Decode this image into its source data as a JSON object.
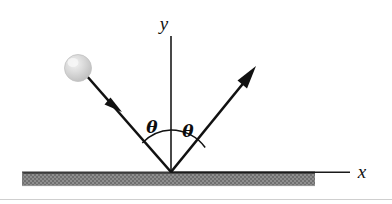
{
  "figure": {
    "background_color": "#ffffff",
    "width": 392,
    "height": 204
  },
  "axes": {
    "y_label": "y",
    "x_label": "x",
    "axis_color": "#1a1a1a",
    "origin": {
      "x": 171,
      "y": 172
    },
    "y_axis_top": {
      "x": 171,
      "y": 36
    },
    "x_axis_right": {
      "x": 350,
      "y": 172
    }
  },
  "ground": {
    "name": "hatched-surface",
    "fill_color": "#8a8a8a",
    "edge_color": "#4a4a4a",
    "x_start": 22,
    "x_end": 315,
    "y_top": 171,
    "y_bottom": 186
  },
  "ball": {
    "label": "",
    "center_x": 78,
    "center_y": 68,
    "radius": 13,
    "fill_color": "#d4d4d4",
    "highlight_color": "#efefef",
    "edge_color": "#b4b4b4"
  },
  "rays": {
    "incoming": {
      "name": "incident-ray",
      "from_x": 88,
      "from_y": 77,
      "to_x": 171,
      "to_y": 172,
      "arrow_at_x": 116,
      "arrow_at_y": 105,
      "color": "#111111"
    },
    "outgoing": {
      "name": "reflected-ray",
      "from_x": 171,
      "from_y": 172,
      "to_x": 255,
      "to_y": 69,
      "color": "#111111"
    }
  },
  "angles": {
    "incident_label": "θ",
    "reflected_label": "θ",
    "arc_radius": 42,
    "incident_label_x": 152,
    "incident_label_y": 128,
    "reflected_label_x": 186,
    "reflected_label_y": 132
  }
}
